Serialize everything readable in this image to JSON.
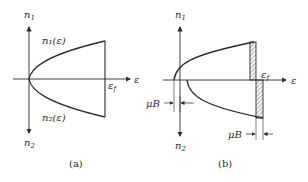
{
  "figure": {
    "panel_a": {
      "caption": "(a)",
      "axis_up_label": "n",
      "axis_up_sub": "1",
      "axis_down_label": "n",
      "axis_down_sub": "2",
      "axis_right_label": "ε",
      "fermi_label": "ε",
      "fermi_sub": "f",
      "upper_curve_label": "n₁(ε)",
      "lower_curve_label": "n₂(ε)"
    },
    "panel_b": {
      "caption": "(b)",
      "axis_up_label": "n",
      "axis_up_sub": "1",
      "axis_down_label": "n",
      "axis_down_sub": "2",
      "axis_right_label": "ε",
      "fermi_label": "ε",
      "fermi_sub": "f",
      "shift_left_label": "μB",
      "shift_right_label": "μB"
    },
    "colors": {
      "ink": "#2a2a2a",
      "background": "#ffffff"
    }
  }
}
